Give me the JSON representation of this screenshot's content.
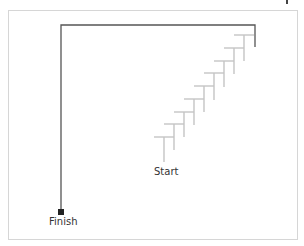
{
  "labels": {
    "start": "Start",
    "finish": "Finish"
  },
  "colors": {
    "path": "#555555",
    "stairs": "#c4c4c4",
    "finish_marker": "#222222",
    "frame": "#d6d6d6"
  },
  "stairs": {
    "step_count": 9
  }
}
